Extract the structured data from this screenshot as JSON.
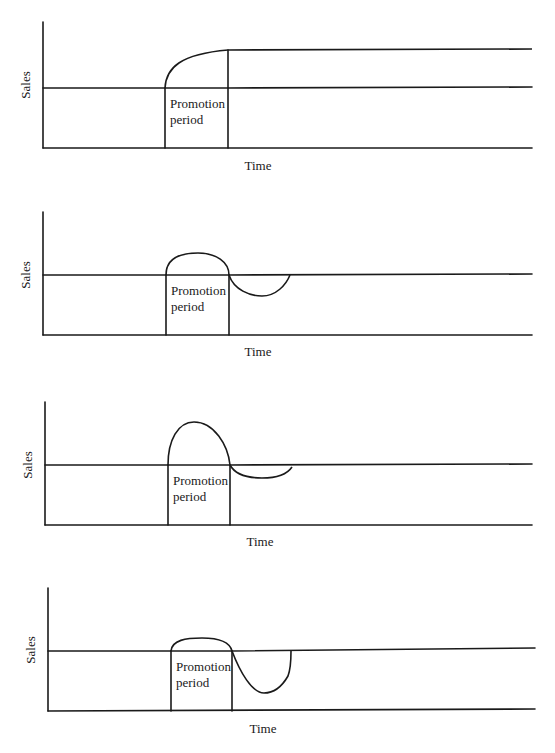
{
  "figure": {
    "width": 555,
    "height": 753,
    "ink_color": "#1a1a1a",
    "background": "#ffffff"
  },
  "chart_data": [
    {
      "type": "line",
      "title": "",
      "xlabel": "Time",
      "ylabel": "Sales",
      "annotation": [
        "Promotion",
        "period"
      ],
      "description": "Sales rise during promotion and stay at the higher level afterwards",
      "series": [
        {
          "name": "Sales",
          "shape": "permanent-increase"
        }
      ],
      "geom": {
        "axis_x": 43,
        "axis_top": 22,
        "floor_y": 148,
        "right": 532,
        "base_y": 88,
        "promo_start": 165,
        "promo_end": 228,
        "xlabel_x": 258,
        "xlabel_y": 170,
        "ylabel_x": 30,
        "ylabel_y": 85,
        "curve": "M165,88 C166,68 180,54 228,50 L532,49",
        "after_base": "M228,88 L532,87"
      }
    },
    {
      "type": "line",
      "title": "",
      "xlabel": "Time",
      "ylabel": "Sales",
      "annotation": [
        "Promotion",
        "period"
      ],
      "description": "Sales bump during promotion, then dip below baseline and recover",
      "series": [
        {
          "name": "Sales",
          "shape": "bump-then-dip"
        }
      ],
      "geom": {
        "axis_x": 43,
        "axis_top": 212,
        "floor_y": 335,
        "right": 532,
        "base_y": 275,
        "promo_start": 166,
        "promo_end": 229,
        "xlabel_x": 258,
        "xlabel_y": 356,
        "ylabel_x": 30,
        "ylabel_y": 275,
        "curve": "M166,275 C166,258 180,253 198,253 C216,253 229,262 229,275 C234,290 250,296 262,296 C276,296 286,285 290,275",
        "after_base": "M229,275 L532,274"
      }
    },
    {
      "type": "line",
      "title": "",
      "xlabel": "Time",
      "ylabel": "Sales",
      "annotation": [
        "Promotion",
        "period"
      ],
      "description": "Large spike during promotion, followed by a shallow, short dip",
      "series": [
        {
          "name": "Sales",
          "shape": "spike-then-shallow-dip"
        }
      ],
      "geom": {
        "axis_x": 45,
        "axis_top": 402,
        "floor_y": 525,
        "right": 532,
        "base_y": 465,
        "promo_start": 168,
        "promo_end": 230,
        "xlabel_x": 260,
        "xlabel_y": 546,
        "ylabel_x": 32,
        "ylabel_y": 465,
        "curve": "M168,465 C168,440 178,422 194,422 C214,422 228,445 230,465 C236,476 250,478 262,478 C278,478 288,473 292,467",
        "after_base": "M230,465 L532,464"
      }
    },
    {
      "type": "line",
      "title": "",
      "xlabel": "Time",
      "ylabel": "Sales",
      "annotation": [
        "Promotion",
        "period"
      ],
      "description": "Small bump during promotion, followed by a deep dip below baseline",
      "series": [
        {
          "name": "Sales",
          "shape": "small-bump-then-deep-dip"
        }
      ],
      "geom": {
        "axis_x": 48,
        "axis_top": 588,
        "floor_y": 711,
        "right": 535,
        "base_y": 651,
        "promo_start": 171,
        "promo_end": 232,
        "xlabel_x": 263,
        "xlabel_y": 733,
        "ylabel_x": 35,
        "ylabel_y": 650,
        "curve": "M171,651 C172,640 186,638 202,638 C220,638 230,643 232,651 C240,672 252,693 264,693 C276,693 284,683 288,676 C291,668 291,658 291,651",
        "after_base": "M232,651 L535,648"
      }
    }
  ]
}
